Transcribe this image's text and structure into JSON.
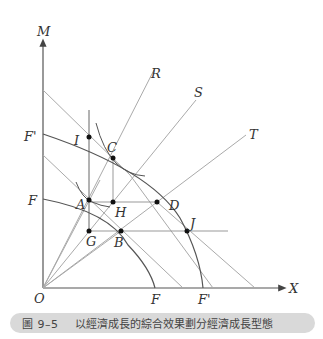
{
  "figure": {
    "axis_labels": {
      "y": "M",
      "x": "X",
      "origin": "O"
    },
    "curve_labels": {
      "F_outer_y": "F'",
      "F_inner_y": "F",
      "F_inner_x": "F",
      "F_outer_x": "F'"
    },
    "ray_labels": {
      "R": "R",
      "S": "S",
      "T": "T"
    },
    "points": [
      {
        "id": "I",
        "label": "I",
        "x": 89,
        "y": 137
      },
      {
        "id": "C",
        "label": "C",
        "x": 113,
        "y": 158
      },
      {
        "id": "A",
        "label": "A",
        "x": 89,
        "y": 200
      },
      {
        "id": "H",
        "label": "H",
        "x": 113,
        "y": 202
      },
      {
        "id": "D",
        "label": "D",
        "x": 157,
        "y": 202
      },
      {
        "id": "G",
        "label": "G",
        "x": 89,
        "y": 231
      },
      {
        "id": "B",
        "label": "B",
        "x": 121,
        "y": 231
      },
      {
        "id": "J",
        "label": "J",
        "x": 187,
        "y": 231
      }
    ]
  },
  "caption": {
    "number": "圖 9–5",
    "text": "以經濟成長的綜合效果劃分經濟成長型態"
  },
  "colors": {
    "axis": "#555555",
    "thin_line": "#aaaaaa",
    "curve": "#555555",
    "caption_bg": "#d9d9d9"
  }
}
